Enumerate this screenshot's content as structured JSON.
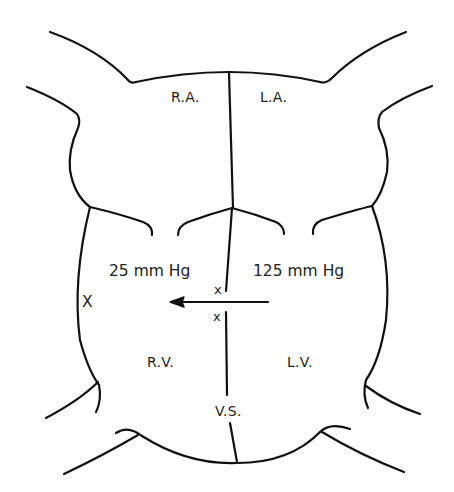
{
  "diagram": {
    "type": "anatomical heart schematic (ventricular septal defect shunt)",
    "labels": {
      "right_atrium": "R.A.",
      "left_atrium": "L.A.",
      "right_ventricle": "R.V.",
      "left_ventricle": "L.V.",
      "ventricular_septum": "V.S."
    },
    "pressures": {
      "right_ventricle": "25 mm Hg",
      "left_ventricle": "125 mm Hg"
    },
    "markers": {
      "septum_upper": "x",
      "septum_lower": "x",
      "rv_wall": "X"
    },
    "arrow": {
      "direction": "left",
      "meaning": "flow from left ventricle to right ventricle"
    },
    "colors": {
      "stroke": "#111111",
      "text": "#222222",
      "background": "#ffffff"
    }
  }
}
